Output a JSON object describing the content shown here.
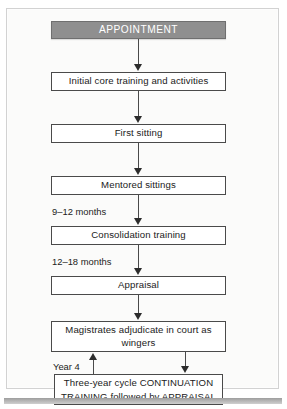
{
  "figure": {
    "kind": "flowchart",
    "orientation": "top-to-bottom",
    "colors": {
      "header_fill": "#8f8f8f",
      "header_text": "#ffffff",
      "node_fill": "#ffffff",
      "node_border": "#4a4a4a",
      "connector": "#2c2c2c",
      "canvas": "#fbfbfa",
      "frame_border": "#d2d2d2",
      "bottom_rule": "#b4b4b4"
    },
    "nodes": [
      {
        "id": "appointment",
        "label": "APPOINTMENT",
        "style": "header"
      },
      {
        "id": "initial-core",
        "label": "Initial core training and activities",
        "style": "plain"
      },
      {
        "id": "first-sitting",
        "label": "First sitting",
        "style": "plain"
      },
      {
        "id": "mentored",
        "label": "Mentored sittings",
        "style": "plain"
      },
      {
        "id": "consolidation",
        "label": "Consolidation training",
        "style": "plain"
      },
      {
        "id": "appraisal",
        "label": "Appraisal",
        "style": "plain"
      },
      {
        "id": "magistrates",
        "label": "Magistrates adjudicate in court as wingers",
        "style": "plain"
      },
      {
        "id": "continuation",
        "label": "Three-year cycle CONTINUATION TRAINING followed by APPRAISAL",
        "style": "plain"
      }
    ],
    "edge_labels": [
      {
        "id": "nine-twelve-months",
        "label": "9–12 months"
      },
      {
        "id": "twelve-eighteen-months",
        "label": "12–18 months"
      },
      {
        "id": "year-four",
        "label": "Year 4"
      }
    ]
  }
}
